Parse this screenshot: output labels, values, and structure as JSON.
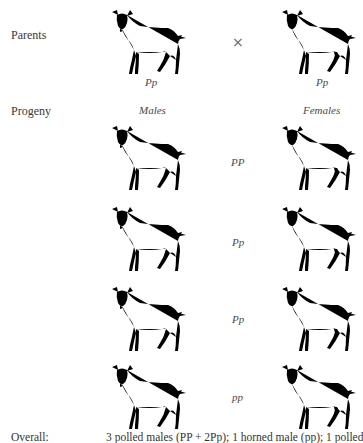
{
  "diagram": {
    "type": "genetic-cross"
  },
  "parents": {
    "row_label": "Parents",
    "cross_symbol": "×",
    "male": {
      "genotype": "Pp",
      "icon": "goat-male-polled-icon"
    },
    "female": {
      "genotype": "Pp",
      "icon": "goat-female-polled-icon"
    }
  },
  "progeny": {
    "row_label": "Progeny",
    "males_header": "Males",
    "females_header": "Females",
    "rows": [
      {
        "genotype": "PP",
        "male_icon": "goat-male-polled-icon",
        "female_icon": "goat-female-polled-icon"
      },
      {
        "genotype": "Pp",
        "male_icon": "goat-male-polled-icon",
        "female_icon": "goat-female-polled-icon"
      },
      {
        "genotype": "Pp",
        "male_icon": "goat-male-polled-icon",
        "female_icon": "goat-female-polled-icon"
      },
      {
        "genotype": "pp",
        "male_icon": "goat-male-horned-icon",
        "female_icon": "goat-female-horned-icon"
      }
    ]
  },
  "footer": {
    "overall_label": "Overall:",
    "summary": "3 polled males (PP + 2Pp); 1 horned male (pp); 1 polled"
  }
}
